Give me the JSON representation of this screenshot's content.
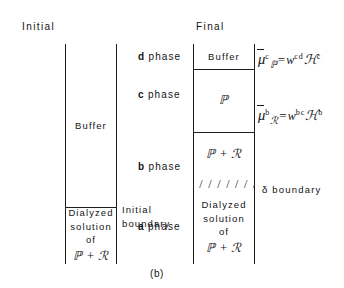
{
  "figure": {
    "caption": "(b)"
  },
  "initial": {
    "header": "Initial",
    "buffer_label": "Buffer",
    "boundary_label_line1": "Initial",
    "boundary_label_line2": "boundary",
    "solution": {
      "line1": "Dialyzed",
      "line2": "solution",
      "line3": "of",
      "line4": "ℙ + ℛ"
    }
  },
  "final": {
    "header": "Final",
    "phases": [
      {
        "letter": "d",
        "word": "phase",
        "content": "Buffer"
      },
      {
        "letter": "c",
        "word": "phase",
        "content": "ℙ"
      },
      {
        "letter": "b",
        "word": "phase",
        "content": "ℙ + ℛ"
      },
      {
        "letter": "a",
        "word": "phase",
        "content": "Dialyzed solution of ℙ + ℛ"
      }
    ],
    "delta_band": {
      "hatch": "/ / / / / / / /",
      "label": "δ boundary"
    },
    "a_phase_lines": {
      "line1": "Dialyzed",
      "line2": "solution",
      "line3": "of",
      "line4": "ℙ + ℛ"
    }
  },
  "equations": [
    {
      "id": "equation-c-phase",
      "mu": "μ",
      "mu_sup": "c",
      "mu_sub": "ℙ",
      "equals": "=",
      "w": "w",
      "w_sup": "cd",
      "h": "ℋ",
      "h_sup": "c"
    },
    {
      "id": "equation-b-phase",
      "mu": "μ",
      "mu_sup": "b",
      "mu_sub": "ℛ",
      "equals": "=",
      "w": "w",
      "w_sup": "bc",
      "h": "ℋ",
      "h_sup": "b"
    }
  ],
  "colors": {
    "ink": "#141414",
    "background": "#ffffff"
  }
}
